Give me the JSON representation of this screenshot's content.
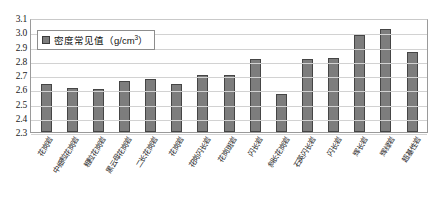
{
  "chart_data": {
    "type": "bar",
    "title": "",
    "subtitle": "",
    "xlabel": "",
    "ylabel": "",
    "ylim": [
      2.3,
      3.1
    ],
    "y_tick_step": 0.1,
    "grid": true,
    "legend_position": "top-left",
    "legend": [
      "密度常见值（g/cm³）"
    ],
    "series_name": "密度常见值（g/cm³）",
    "unit": "g/cm³",
    "categories": [
      "花岗岩",
      "中细粒花岗岩",
      "粗粒花岗岩",
      "黑云母花岗岩",
      "二长花岗岩",
      "花岗岩",
      "花岗闪长岩",
      "花岗斑岩",
      "闪长岩",
      "斜长花岗岩",
      "石英闪长岩",
      "闪长岩",
      "辉长岩",
      "辉绿岩",
      "超基性岩"
    ],
    "values": [
      2.64,
      2.61,
      2.6,
      2.66,
      2.67,
      2.64,
      2.7,
      2.7,
      2.81,
      2.57,
      2.81,
      2.82,
      2.98,
      3.02,
      2.86
    ],
    "y_ticks": [
      "3.1",
      "3.0",
      "2.9",
      "2.8",
      "2.7",
      "2.6",
      "2.5",
      "2.4",
      "2.3"
    ],
    "colors": {
      "bar_fill": "#7d7d7d",
      "bar_border": "#454545",
      "gridline": "#d2d2d2",
      "axis": "#9a9a9a",
      "text": "#1a1a1a",
      "background": "#ffffff"
    }
  },
  "legend": {
    "label_prefix": "密度常见值（g/cm",
    "label_sup": "3",
    "label_suffix": "）"
  }
}
